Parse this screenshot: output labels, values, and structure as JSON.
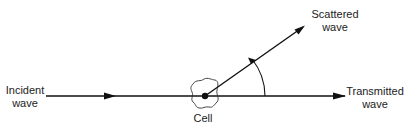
{
  "diagram": {
    "labels": {
      "incident_line1": "Incident",
      "incident_line2": "wave",
      "scattered_line1": "Scattered",
      "scattered_line2": "wave",
      "transmitted_line1": "Transmitted",
      "transmitted_line2": "wave",
      "cell": "Cell"
    },
    "colors": {
      "stroke": "#111111",
      "text": "#222222"
    }
  }
}
